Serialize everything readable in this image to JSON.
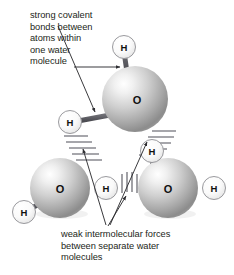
{
  "figure": {
    "background_color": "#ffffff",
    "text_color": "#231f20",
    "annotations": [
      {
        "id": "covalent",
        "text": "strong covalent\nbonds between\natoms within\none water\nmolecule",
        "lines": [
          "strong covalent",
          "bonds between",
          "atoms within",
          "one water",
          "molecule"
        ],
        "position": {
          "x": 30,
          "y": 10
        },
        "leaders": 2
      },
      {
        "id": "intermolecular",
        "text": "weak intermolecular forces\nbetween separate water\nmolecules",
        "lines": [
          "weak intermolecular forces",
          "between separate water",
          "molecules"
        ],
        "position": {
          "x": 61,
          "y": 229
        },
        "leaders": 3
      }
    ],
    "molecules": [
      {
        "id": "top-water-molecule",
        "oxygen": {
          "label": "O",
          "cx": 135,
          "cy": 99,
          "r": 33
        },
        "hydrogens": [
          {
            "label": "H",
            "cx": 124,
            "cy": 47,
            "r": 11.5
          },
          {
            "label": "H",
            "cx": 70,
            "cy": 122,
            "r": 11.5
          }
        ]
      },
      {
        "id": "left-water-molecule",
        "oxygen": {
          "label": "O",
          "cx": 60,
          "cy": 188,
          "r": 30
        },
        "hydrogens": [
          {
            "label": "H",
            "cx": 106,
            "cy": 188,
            "r": 11.5
          },
          {
            "label": "H",
            "cx": 24,
            "cy": 212,
            "r": 11.5
          }
        ]
      },
      {
        "id": "right-water-molecule",
        "oxygen": {
          "label": "O",
          "cx": 168,
          "cy": 188,
          "r": 30
        },
        "hydrogens": [
          {
            "label": "H",
            "cx": 152,
            "cy": 151,
            "r": 11.5
          },
          {
            "label": "H",
            "cx": 214,
            "cy": 188,
            "r": 11.5
          }
        ]
      }
    ],
    "hydrogen_bonds": [
      {
        "id": "bond-left-diagonal",
        "dash_count": 5,
        "orientation": "diagonal-down-right"
      },
      {
        "id": "bond-right-diagonal",
        "dash_count": 5,
        "orientation": "diagonal-down-left"
      },
      {
        "id": "bond-center-vertical",
        "dash_count": 4,
        "orientation": "vertical"
      }
    ],
    "colors": {
      "oxygen_light": "#f2f2f2",
      "oxygen_mid": "#b9b9b9",
      "oxygen_dark": "#7d7d7d",
      "hydrogen_light": "#fdfdfd",
      "hydrogen_mid": "#e3e3e3",
      "bond_stroke": "#55555a",
      "leader_stroke": "#3a3a3e",
      "dash_stroke": "#9a9a9f"
    }
  }
}
